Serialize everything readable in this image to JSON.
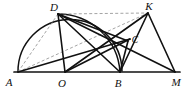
{
  "figure": {
    "width": 190,
    "height": 89,
    "background_color": "#ffffff",
    "stroke_color": "#111111",
    "dashed_color": "#8c8c8c"
  },
  "points": [
    {
      "id": "A",
      "label": "A",
      "x": 18,
      "y": 72,
      "label_x": 9,
      "label_y": 85
    },
    {
      "id": "O",
      "label": "O",
      "x": 65,
      "y": 72,
      "label_x": 60,
      "label_y": 86
    },
    {
      "id": "B",
      "label": "B",
      "x": 120,
      "y": 72,
      "label_x": 115,
      "label_y": 86
    },
    {
      "id": "M",
      "label": "M",
      "x": 175,
      "y": 72,
      "label_x": 170,
      "label_y": 85
    },
    {
      "id": "D",
      "label": "D",
      "x": 58,
      "y": 14,
      "label_x": 52,
      "label_y": 11
    },
    {
      "id": "K",
      "label": "K",
      "x": 148,
      "y": 13,
      "label_x": 145,
      "label_y": 10
    },
    {
      "id": "C",
      "label": "C",
      "x": 128,
      "y": 41,
      "label_x": 132,
      "label_y": 43
    }
  ],
  "segments": [
    {
      "id": "A-M",
      "from": "A",
      "to": "M",
      "style": "solid",
      "weight": 1.6
    },
    {
      "id": "A-D",
      "from": "A",
      "to": "D",
      "style": "dashed",
      "weight": 0.9
    },
    {
      "id": "A-K",
      "from": "A",
      "to": "K",
      "style": "dashed",
      "weight": 0.9
    },
    {
      "id": "D-K",
      "from": "D",
      "to": "K",
      "style": "dashed",
      "weight": 0.9
    },
    {
      "id": "D-O",
      "from": "D",
      "to": "O",
      "style": "solid",
      "weight": 1.6
    },
    {
      "id": "D-B",
      "from": "D",
      "to": "B",
      "style": "solid",
      "weight": 1.6
    },
    {
      "id": "D-C",
      "from": "D",
      "to": "C",
      "style": "solid",
      "weight": 1.6
    },
    {
      "id": "D-M",
      "from": "D",
      "to": "M",
      "style": "solid",
      "weight": 1.6
    },
    {
      "id": "K-O",
      "from": "K",
      "to": "O",
      "style": "solid",
      "weight": 1.6
    },
    {
      "id": "K-B",
      "from": "K",
      "to": "B",
      "style": "solid",
      "weight": 1.6
    },
    {
      "id": "K-M",
      "from": "K",
      "to": "M",
      "style": "solid",
      "weight": 1.6
    },
    {
      "id": "A-C",
      "from": "A",
      "to": "C",
      "style": "solid",
      "weight": 1.6
    },
    {
      "id": "O-C",
      "from": "O",
      "to": "C",
      "style": "solid",
      "weight": 1.6
    },
    {
      "id": "C-B",
      "from": "C",
      "to": "B",
      "style": "solid",
      "weight": 1.6
    }
  ],
  "arcs": [
    {
      "id": "arc-A-D-B",
      "description": "large semicircular arc from A up over D descending toward B",
      "path": "M 18 72 A 52 52 0 0 1 122 71",
      "style": "solid",
      "weight": 1.6
    },
    {
      "id": "arc-D-C-B",
      "description": "smaller arc from D through C down to B",
      "path": "M 58 14 A 62 62 0 0 1 120 72",
      "style": "solid",
      "weight": 1.6
    }
  ],
  "labels": {
    "A": "A",
    "O": "O",
    "B": "B",
    "M": "M",
    "D": "D",
    "K": "K",
    "C": "C"
  }
}
